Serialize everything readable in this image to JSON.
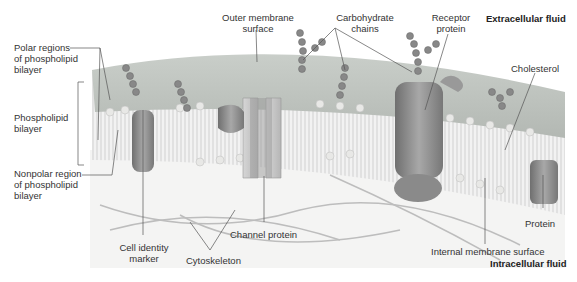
{
  "diagram": {
    "regions": {
      "extracellular": "Extracellular fluid",
      "intracellular": "Intracellular fluid"
    },
    "labels": {
      "polar_regions": "Polar regions\nof phospholipid\nbilayer",
      "phospholipid_bilayer": "Phospholipid\nbilayer",
      "nonpolar_region": "Nonpolar region\nof phospholipid\nbilayer",
      "outer_membrane_surface": "Outer membrane\nsurface",
      "carbohydrate_chains": "Carbohydrate\nchains",
      "receptor_protein": "Receptor\nprotein",
      "cholesterol": "Cholesterol",
      "cell_identity_marker": "Cell identity\nmarker",
      "cytoskeleton": "Cytoskeleton",
      "channel_protein": "Channel protein",
      "protein": "Protein",
      "internal_membrane_surface": "Internal membrane surface"
    }
  }
}
